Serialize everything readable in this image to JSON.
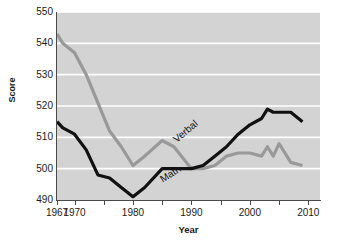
{
  "chart_data": {
    "type": "line",
    "title": "",
    "xlabel": "Year",
    "ylabel": "Score",
    "xlim": [
      1967,
      2012
    ],
    "ylim": [
      490,
      550
    ],
    "y_ticks": [
      490,
      500,
      510,
      520,
      530,
      540,
      550
    ],
    "x_ticks": [
      1967,
      1970,
      1975,
      1980,
      1985,
      1990,
      1995,
      2000,
      2005,
      2010
    ],
    "x_tick_labels": [
      "1967",
      "1970",
      "1980",
      "1990",
      "2000",
      "2010"
    ],
    "x_tick_label_years": [
      1967,
      1970,
      1980,
      1990,
      2000,
      2010
    ],
    "grid": "horizontal-white",
    "legend_position": "inline-on-line",
    "plot_background": "#d3d3d3",
    "gridline_color": "#ffffff",
    "series": [
      {
        "name": "Verbal",
        "color": "#999999",
        "x": [
          1967,
          1968,
          1970,
          1972,
          1974,
          1976,
          1978,
          1980,
          1982,
          1985,
          1987,
          1990,
          1992,
          1994,
          1996,
          1998,
          2000,
          2002,
          2003,
          2004,
          2005,
          2006,
          2007,
          2009
        ],
        "values": [
          543,
          540,
          537,
          530,
          521,
          512,
          507,
          501,
          504,
          509,
          507,
          500,
          500,
          501,
          504,
          505,
          505,
          504,
          507,
          504,
          508,
          505,
          502,
          501
        ]
      },
      {
        "name": "Math",
        "color": "#111111",
        "x": [
          1967,
          1968,
          1970,
          1972,
          1974,
          1976,
          1978,
          1980,
          1982,
          1985,
          1987,
          1990,
          1992,
          1994,
          1996,
          1998,
          2000,
          2002,
          2003,
          2004,
          2005,
          2006,
          2007,
          2009
        ],
        "values": [
          515,
          513,
          511,
          506,
          498,
          497,
          494,
          491,
          494,
          500,
          500,
          500,
          501,
          504,
          507,
          511,
          514,
          516,
          519,
          518,
          518,
          518,
          518,
          515
        ]
      }
    ]
  },
  "axes": {
    "y_title": "Score",
    "x_title": "Year",
    "y_tick_labels": [
      "550",
      "540",
      "530",
      "520",
      "510",
      "500",
      "490"
    ]
  },
  "labels": {
    "verbal": "Verbal",
    "math": "Math"
  }
}
